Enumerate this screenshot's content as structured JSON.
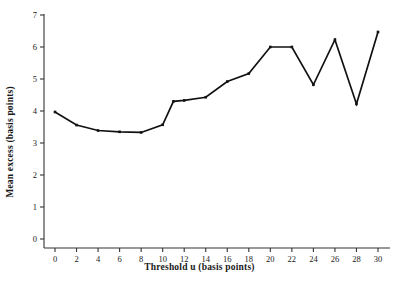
{
  "chart_data": {
    "type": "line",
    "title": "",
    "subtitle": "",
    "xlabel": "Threshold u (basis points)",
    "ylabel": "Mean excess (basis points)",
    "xlim": [
      0,
      30
    ],
    "ylim": [
      0,
      7
    ],
    "grid": false,
    "legend": "none",
    "marker": "filled-square",
    "line_color": "#111111",
    "marker_color": "#111111",
    "x": [
      0,
      2,
      4,
      6,
      8,
      10,
      11,
      12,
      14,
      16,
      18,
      20,
      22,
      24,
      26,
      28,
      30
    ],
    "values": [
      3.97,
      3.56,
      3.39,
      3.35,
      3.33,
      3.57,
      4.3,
      4.33,
      4.43,
      4.92,
      5.17,
      6.0,
      6.0,
      4.82,
      6.23,
      4.22,
      6.47
    ],
    "xticks": [
      0,
      2,
      4,
      6,
      8,
      10,
      12,
      14,
      16,
      18,
      20,
      22,
      24,
      26,
      28,
      30
    ],
    "xtick_labels": [
      "0",
      "2",
      "4",
      "6",
      "8",
      "10",
      "12",
      "14",
      "16",
      "18",
      "20",
      "22",
      "24",
      "26",
      "28",
      "30"
    ],
    "yticks": [
      0,
      1,
      2,
      3,
      4,
      5,
      6,
      7
    ],
    "ytick_labels": [
      "0",
      "1",
      "2",
      "3",
      "4",
      "5",
      "6",
      "7"
    ]
  }
}
